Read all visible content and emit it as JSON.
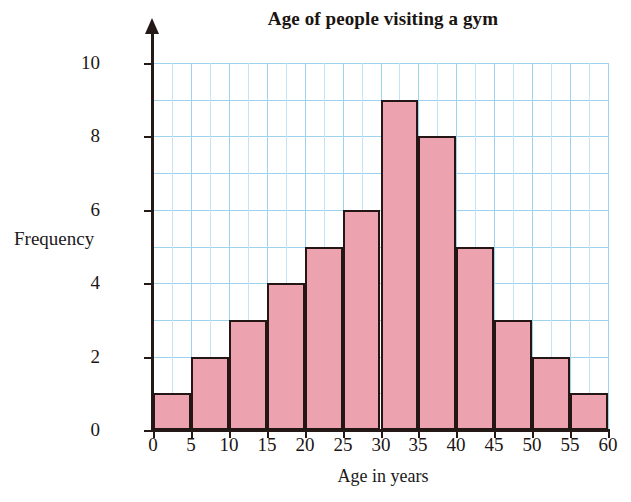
{
  "chart_data": {
    "type": "bar",
    "title": "Age of people visiting a gym",
    "xlabel": "Age in years",
    "ylabel": "Frequency",
    "categories": [
      "0-5",
      "5-10",
      "10-15",
      "15-20",
      "20-25",
      "25-30",
      "30-35",
      "35-40",
      "40-45",
      "45-50",
      "50-55",
      "55-60"
    ],
    "bin_edges": [
      0,
      5,
      10,
      15,
      20,
      25,
      30,
      35,
      40,
      45,
      50,
      55,
      60
    ],
    "values": [
      1,
      2,
      3,
      4,
      5,
      6,
      9,
      8,
      5,
      3,
      2,
      1
    ],
    "xlim": [
      0,
      60
    ],
    "ylim": [
      0,
      10
    ],
    "x_tick_labels": [
      "0",
      "5",
      "10",
      "15",
      "20",
      "25",
      "30",
      "35",
      "40",
      "45",
      "50",
      "55",
      "60"
    ],
    "x_tick_values": [
      0,
      5,
      10,
      15,
      20,
      25,
      30,
      35,
      40,
      45,
      50,
      55,
      60
    ],
    "y_tick_labels": [
      "0",
      "2",
      "4",
      "6",
      "8",
      "10"
    ],
    "y_tick_values": [
      0,
      2,
      4,
      6,
      8,
      10
    ],
    "grid": true,
    "grid_major_y_step": 1,
    "grid_major_x_step": 5,
    "grid_minor_x_step": 2.5,
    "legend": null,
    "colors": {
      "bar_fill": "#eda3af",
      "bar_border": "#241614",
      "gridline": "#9ed3ef",
      "gridline_minor": "#c3e4f6",
      "axis": "#231a18",
      "text": "#1c1514",
      "background": "#ffffff"
    }
  }
}
